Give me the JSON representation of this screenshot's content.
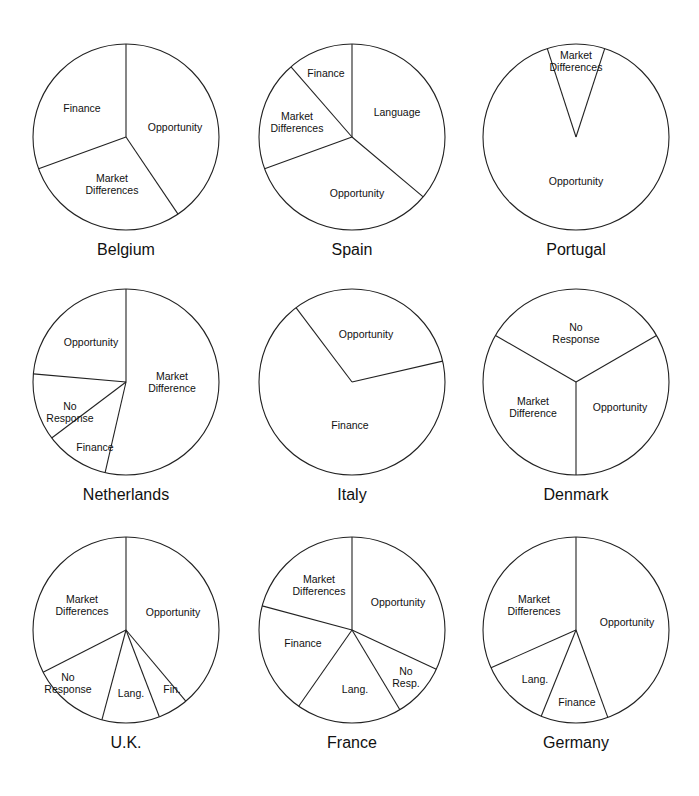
{
  "chart_data": {
    "type": "pie",
    "layout": "3x3 grid of pie charts",
    "charts": [
      {
        "title": "Belgium",
        "slices": [
          {
            "label": "Opportunity",
            "value": 40
          },
          {
            "label": "Market Differences",
            "value": 29
          },
          {
            "label": "Finance",
            "value": 31
          }
        ]
      },
      {
        "title": "Spain",
        "slices": [
          {
            "label": "Language",
            "value": 36
          },
          {
            "label": "Opportunity",
            "value": 33
          },
          {
            "label": "Market Differences",
            "value": 19
          },
          {
            "label": "Finance",
            "value": 12
          }
        ]
      },
      {
        "title": "Portugal",
        "slices": [
          {
            "label": "Market Differences",
            "value": 10
          },
          {
            "label": "Opportunity",
            "value": 90
          }
        ]
      },
      {
        "title": "Netherlands",
        "slices": [
          {
            "label": "Market Difference",
            "value": 53
          },
          {
            "label": "Finance",
            "value": 10
          },
          {
            "label": "No Response",
            "value": 12
          },
          {
            "label": "Opportunity",
            "value": 25
          }
        ]
      },
      {
        "title": "Italy",
        "slices": [
          {
            "label": "Opportunity",
            "value": 30
          },
          {
            "label": "Finance",
            "value": 70
          }
        ]
      },
      {
        "title": "Denmark",
        "slices": [
          {
            "label": "No Response",
            "value": 33
          },
          {
            "label": "Opportunity",
            "value": 33
          },
          {
            "label": "Market Difference",
            "value": 34
          }
        ]
      },
      {
        "title": "U.K.",
        "slices": [
          {
            "label": "Opportunity",
            "value": 39
          },
          {
            "label": "Fin.",
            "value": 6
          },
          {
            "label": "Lang.",
            "value": 11
          },
          {
            "label": "No Response",
            "value": 14
          },
          {
            "label": "Market Differences",
            "value": 30
          }
        ]
      },
      {
        "title": "France",
        "slices": [
          {
            "label": "Opportunity",
            "value": 32
          },
          {
            "label": "No Resp.",
            "value": 10
          },
          {
            "label": "Lang.",
            "value": 19
          },
          {
            "label": "Finance",
            "value": 20
          },
          {
            "label": "Market Differences",
            "value": 19
          }
        ]
      },
      {
        "title": "Germany",
        "slices": [
          {
            "label": "Opportunity",
            "value": 44
          },
          {
            "label": "Finance",
            "value": 12
          },
          {
            "label": "Lang.",
            "value": 12
          },
          {
            "label": "Market Differences",
            "value": 32
          }
        ]
      }
    ]
  },
  "pies": [
    {
      "title": "Belgium",
      "cx": 126,
      "cy": 137,
      "r": 93,
      "angles": [
        0,
        146,
        250
      ],
      "labels": [
        {
          "text": "Opportunity",
          "x": 175,
          "y": 127
        },
        {
          "text": "Market\nDifferences",
          "x": 112,
          "y": 184
        },
        {
          "text": "Finance",
          "x": 82,
          "y": 108
        }
      ]
    },
    {
      "title": "Spain",
      "cx": 352,
      "cy": 137,
      "r": 93,
      "angles": [
        0,
        130,
        250,
        319
      ],
      "labels": [
        {
          "text": "Language",
          "x": 397,
          "y": 112
        },
        {
          "text": "Opportunity",
          "x": 357,
          "y": 193
        },
        {
          "text": "Market\nDifferences",
          "x": 297,
          "y": 122
        },
        {
          "text": "Finance",
          "x": 326,
          "y": 73
        }
      ]
    },
    {
      "title": "Portugal",
      "cx": 576,
      "cy": 137,
      "r": 93,
      "angles": [
        -18,
        18
      ],
      "labels": [
        {
          "text": "Market\nDifferences",
          "x": 576,
          "y": 61
        },
        {
          "text": "Opportunity",
          "x": 576,
          "y": 181
        }
      ]
    },
    {
      "title": "Netherlands",
      "cx": 126,
      "cy": 382,
      "r": 93,
      "angles": [
        0,
        193,
        233,
        275
      ],
      "labels": [
        {
          "text": "Market\nDifference",
          "x": 172,
          "y": 382
        },
        {
          "text": "Finance",
          "x": 95,
          "y": 447
        },
        {
          "text": "No\nResponse",
          "x": 70,
          "y": 412
        },
        {
          "text": "Opportunity",
          "x": 91,
          "y": 342
        }
      ]
    },
    {
      "title": "Italy",
      "cx": 352,
      "cy": 382,
      "r": 93,
      "angles": [
        -37,
        77
      ],
      "labels": [
        {
          "text": "Opportunity",
          "x": 366,
          "y": 334
        },
        {
          "text": "Finance",
          "x": 350,
          "y": 425
        }
      ]
    },
    {
      "title": "Denmark",
      "cx": 576,
      "cy": 382,
      "r": 93,
      "angles": [
        -60,
        60,
        180
      ],
      "labels": [
        {
          "text": "No\nResponse",
          "x": 576,
          "y": 333
        },
        {
          "text": "Opportunity",
          "x": 620,
          "y": 407
        },
        {
          "text": "Market\nDifference",
          "x": 533,
          "y": 407
        }
      ]
    },
    {
      "title": "U.K.",
      "cx": 126,
      "cy": 630,
      "r": 93,
      "angles": [
        0,
        140,
        159,
        195,
        243
      ],
      "labels": [
        {
          "text": "Opportunity",
          "x": 173,
          "y": 612
        },
        {
          "text": "Fin.",
          "x": 172,
          "y": 689
        },
        {
          "text": "Lang.",
          "x": 131,
          "y": 693
        },
        {
          "text": "No\nResponse",
          "x": 68,
          "y": 683
        },
        {
          "text": "Market\nDifferences",
          "x": 82,
          "y": 605
        }
      ]
    },
    {
      "title": "France",
      "cx": 352,
      "cy": 630,
      "r": 93,
      "angles": [
        0,
        115,
        149,
        215,
        285
      ],
      "labels": [
        {
          "text": "Opportunity",
          "x": 398,
          "y": 602
        },
        {
          "text": "No\nResp.",
          "x": 406,
          "y": 677
        },
        {
          "text": "Lang.",
          "x": 355,
          "y": 689
        },
        {
          "text": "Finance",
          "x": 303,
          "y": 643
        },
        {
          "text": "Market\nDifferences",
          "x": 319,
          "y": 585
        }
      ]
    },
    {
      "title": "Germany",
      "cx": 576,
      "cy": 630,
      "r": 93,
      "angles": [
        0,
        160,
        202,
        246
      ],
      "labels": [
        {
          "text": "Opportunity",
          "x": 627,
          "y": 622
        },
        {
          "text": "Finance",
          "x": 577,
          "y": 702
        },
        {
          "text": "Lang.",
          "x": 535,
          "y": 679
        },
        {
          "text": "Market\nDifferences",
          "x": 534,
          "y": 605
        }
      ]
    }
  ]
}
